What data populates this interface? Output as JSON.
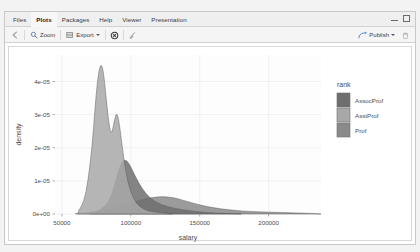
{
  "window": {
    "tabs": [
      {
        "label": "Files",
        "active": false
      },
      {
        "label": "Plots",
        "active": true
      },
      {
        "label": "Packages",
        "active": false
      },
      {
        "label": "Help",
        "active": false
      },
      {
        "label": "Viewer",
        "active": false
      },
      {
        "label": "Presentation",
        "active": false
      }
    ],
    "controls": {
      "minimize": "minimize-icon",
      "maximize": "maximize-icon"
    }
  },
  "toolbar": {
    "back_icon": "back-arrow-icon",
    "zoom_label": "Zoom",
    "zoom_icon": "magnifier-icon",
    "export_label": "Export",
    "export_icon": "export-icon",
    "remove_icon": "remove-plot-icon",
    "clear_icon": "broom-icon",
    "publish_label": "Publish",
    "publish_icon": "publish-icon",
    "trash_icon": "trash-icon"
  },
  "chart_data": {
    "type": "area",
    "title": "",
    "xlabel": "salary",
    "ylabel": "density",
    "xlim": [
      45000,
      238000
    ],
    "ylim": [
      0,
      4.8e-05
    ],
    "xticks": [
      50000,
      100000,
      150000,
      200000
    ],
    "xticklabels": [
      "50000",
      "100000",
      "150000",
      "200000"
    ],
    "yticks": [
      0,
      1e-05,
      2e-05,
      3e-05,
      4e-05
    ],
    "yticklabels": [
      "0e+00",
      "1e-05",
      "2e-05",
      "3e-05",
      "4e-05"
    ],
    "grid": true,
    "legend": {
      "title": "rank",
      "position": "right",
      "entries": [
        {
          "label": "AssocProf",
          "color": "#6e6e6e"
        },
        {
          "label": "AsstProf",
          "color": "#a8a8a8"
        },
        {
          "label": "Prof",
          "color": "#8a8a8a"
        }
      ]
    },
    "series": [
      {
        "name": "AsstProf",
        "color": "#a8a8a8",
        "opacity": 0.85,
        "peak_x": 80000,
        "peak_y": 4.55e-05,
        "points": [
          [
            62000,
            0.02
          ],
          [
            66000,
            0.08
          ],
          [
            69000,
            0.22
          ],
          [
            72000,
            0.45
          ],
          [
            74000,
            0.7
          ],
          [
            76000,
            0.9
          ],
          [
            78000,
            1.0
          ],
          [
            80000,
            0.96
          ],
          [
            82000,
            0.78
          ],
          [
            84000,
            0.6
          ],
          [
            86000,
            0.52
          ],
          [
            88000,
            0.62
          ],
          [
            90000,
            0.68
          ],
          [
            92000,
            0.58
          ],
          [
            95000,
            0.36
          ],
          [
            98000,
            0.2
          ],
          [
            102000,
            0.1
          ],
          [
            106000,
            0.05
          ],
          [
            112000,
            0.02
          ],
          [
            120000,
            0.01
          ],
          [
            130000,
            0.0
          ]
        ]
      },
      {
        "name": "AssocProf",
        "color": "#6e6e6e",
        "opacity": 0.85,
        "peak_x": 96000,
        "peak_y": 2.75e-05,
        "points": [
          [
            70000,
            0.01
          ],
          [
            76000,
            0.03
          ],
          [
            82000,
            0.09
          ],
          [
            86000,
            0.2
          ],
          [
            90000,
            0.42
          ],
          [
            93000,
            0.56
          ],
          [
            96000,
            0.6
          ],
          [
            99000,
            0.55
          ],
          [
            103000,
            0.42
          ],
          [
            108000,
            0.28
          ],
          [
            114000,
            0.17
          ],
          [
            122000,
            0.1
          ],
          [
            132000,
            0.06
          ],
          [
            145000,
            0.03
          ],
          [
            160000,
            0.01
          ],
          [
            180000,
            0.0
          ]
        ]
      },
      {
        "name": "Prof",
        "color": "#8a8a8a",
        "opacity": 0.85,
        "peak_x": 125000,
        "peak_y": 1.55e-05,
        "points": [
          [
            60000,
            0.01
          ],
          [
            72000,
            0.03
          ],
          [
            82000,
            0.07
          ],
          [
            92000,
            0.14
          ],
          [
            100000,
            0.22
          ],
          [
            108000,
            0.28
          ],
          [
            115000,
            0.32
          ],
          [
            122000,
            0.34
          ],
          [
            128000,
            0.33
          ],
          [
            134000,
            0.3
          ],
          [
            140000,
            0.25
          ],
          [
            148000,
            0.19
          ],
          [
            156000,
            0.14
          ],
          [
            165000,
            0.1
          ],
          [
            175000,
            0.07
          ],
          [
            185000,
            0.05
          ],
          [
            196000,
            0.04
          ],
          [
            208000,
            0.03
          ],
          [
            220000,
            0.02
          ],
          [
            232000,
            0.01
          ],
          [
            238000,
            0.0
          ]
        ]
      }
    ]
  }
}
